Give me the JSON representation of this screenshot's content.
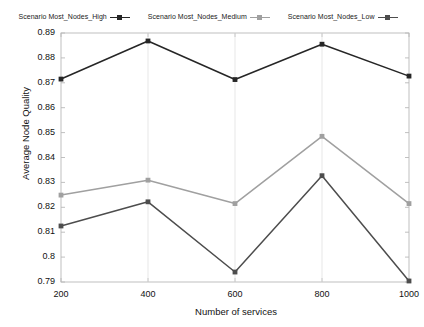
{
  "chart_data": {
    "type": "line",
    "title": "",
    "xlabel": "Number of services",
    "ylabel": "Average Node Quality",
    "x": [
      200,
      400,
      600,
      800,
      1000
    ],
    "xticklabels": [
      "200",
      "400",
      "600",
      "800",
      "1000"
    ],
    "yticklabels": [
      "0.89",
      "0.88",
      "0.87",
      "0.86",
      "0.85",
      "0.84",
      "0.83",
      "0.82",
      "0.81",
      "0.8",
      "0.79"
    ],
    "yticks": [
      0.89,
      0.88,
      0.87,
      0.86,
      0.85,
      0.84,
      0.83,
      0.82,
      0.81,
      0.8,
      0.79
    ],
    "ylim": [
      0.79,
      0.89
    ],
    "xlim": [
      200,
      1000
    ],
    "grid": false,
    "legend_position": "top",
    "series": [
      {
        "name": "Scenario Most_Nodes_High",
        "color": "#262626",
        "marker": "square",
        "values": [
          0.8715,
          0.8868,
          0.8713,
          0.8855,
          0.8727
        ]
      },
      {
        "name": "Scenario Most_Nodes_Medium",
        "color": "#a0a0a0",
        "marker": "square",
        "values": [
          0.8249,
          0.8309,
          0.8215,
          0.8485,
          0.8215
        ]
      },
      {
        "name": "Scenario Most_Nodes_Low",
        "color": "#4d4d4d",
        "marker": "square",
        "values": [
          0.8125,
          0.8222,
          0.794,
          0.8327,
          0.7904
        ]
      }
    ]
  },
  "legend": {
    "entries": [
      {
        "label": "Scenario Most_Nodes_High"
      },
      {
        "label": "Scenario Most_Nodes_Medium"
      },
      {
        "label": "Scenario Most_Nodes_Low"
      }
    ]
  },
  "axes": {
    "x_title": "Number of services",
    "y_title": "Average Node Quality"
  }
}
